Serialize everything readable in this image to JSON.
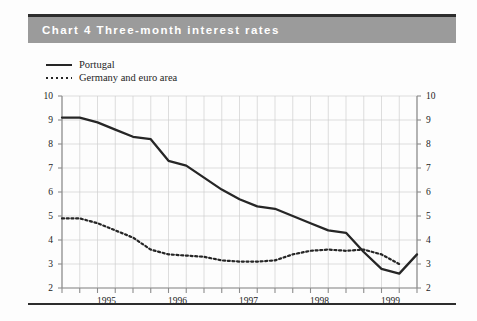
{
  "header": {
    "chart_number": "Chart 4",
    "title": "Three-month interest rates",
    "full_title": "Chart 4  Three-month interest rates",
    "band_color": "#9b9b9b",
    "title_color": "#ffffff"
  },
  "legend": {
    "position": "top-left",
    "items": [
      {
        "label": "Portugal",
        "style": "solid",
        "color": "#262626"
      },
      {
        "label": "Germany and euro area",
        "style": "dotted",
        "color": "#262626"
      }
    ]
  },
  "axes": {
    "y_left_ticks": [
      "10",
      "9",
      "8",
      "7",
      "6",
      "5",
      "4",
      "3",
      "2"
    ],
    "y_right_ticks": [
      "10",
      "9",
      "8",
      "7",
      "6",
      "5",
      "4",
      "3",
      "2"
    ],
    "x_tick_labels": [
      "1995",
      "1996",
      "1997",
      "1998",
      "1999"
    ],
    "ylim": [
      2,
      10
    ],
    "grid": "on"
  },
  "chart_data": {
    "type": "line",
    "title": "Three-month interest rates",
    "subtitle": "",
    "xlabel": "",
    "ylabel": "",
    "ylim": [
      2,
      10
    ],
    "xlim": [
      "1994-Q4",
      "1999-Q4"
    ],
    "grid": true,
    "legend_position": "top-left",
    "x": [
      "1994-Q4",
      "1995-Q1",
      "1995-Q2",
      "1995-Q3",
      "1995-Q4",
      "1996-Q1",
      "1996-Q2",
      "1996-Q3",
      "1996-Q4",
      "1997-Q1",
      "1997-Q2",
      "1997-Q3",
      "1997-Q4",
      "1998-Q1",
      "1998-Q2",
      "1998-Q3",
      "1998-Q4",
      "1999-Q1",
      "1999-Q2",
      "1999-Q3",
      "1999-Q4"
    ],
    "x_tick_labels": [
      "1995",
      "1996",
      "1997",
      "1998",
      "1999"
    ],
    "series": [
      {
        "name": "Portugal",
        "style": "solid",
        "color": "#262626",
        "values": [
          9.1,
          9.1,
          8.9,
          8.6,
          8.3,
          8.2,
          7.3,
          7.1,
          6.6,
          6.1,
          5.7,
          5.4,
          5.3,
          5.0,
          4.7,
          4.4,
          4.3,
          3.5,
          2.8,
          2.6,
          3.4
        ]
      },
      {
        "name": "Germany and euro area",
        "style": "dotted",
        "color": "#262626",
        "values": [
          4.9,
          4.9,
          4.7,
          4.4,
          4.1,
          3.6,
          3.4,
          3.35,
          3.3,
          3.15,
          3.1,
          3.1,
          3.15,
          3.4,
          3.55,
          3.6,
          3.55,
          3.6,
          3.4,
          3.0,
          null
        ]
      }
    ]
  }
}
